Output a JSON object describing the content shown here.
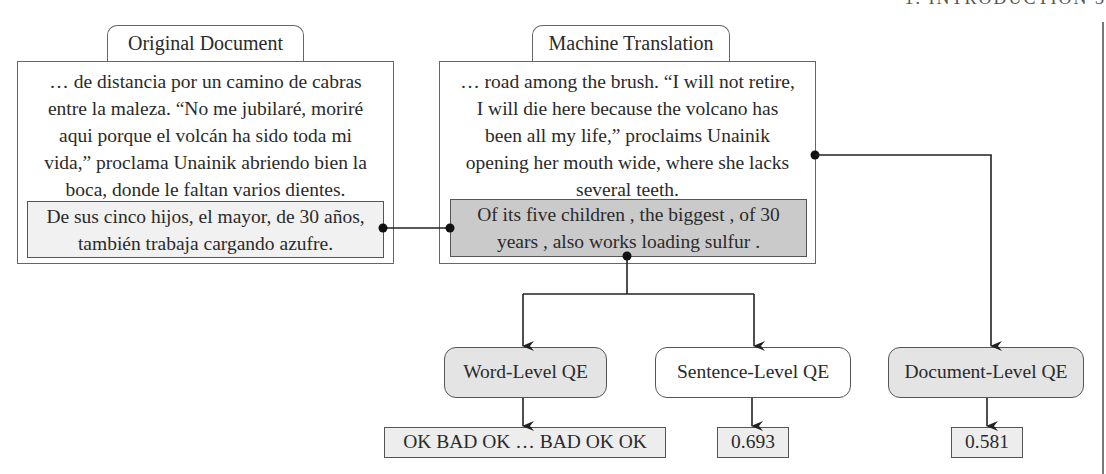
{
  "page_header": "1. INTRODUCTION   3",
  "original_document": {
    "tab_label": "Original Document",
    "context_lines": [
      "… de distancia por un camino de cabras",
      "entre la maleza. “No me jubilaré, moriré",
      "aqui porque el volcán ha sido toda mi",
      "vida,” proclama Unainik abriendo bien la",
      "boca, donde le faltan varios dientes."
    ],
    "highlighted_sentence_lines": [
      "De sus cinco hijos, el mayor, de 30 años,",
      "también trabaja cargando azufre."
    ]
  },
  "machine_translation": {
    "tab_label": "Machine Translation",
    "context_lines": [
      "… road among the brush. “I will not retire,",
      "I will die here because the volcano has",
      "been all my life,” proclaims Unainik",
      "opening her mouth wide, where she lacks",
      "several teeth."
    ],
    "highlighted_sentence_lines": [
      "Of its five children , the biggest , of 30",
      "years , also works loading sulfur ."
    ]
  },
  "qe_levels": [
    {
      "label": "Word-Level QE",
      "result": "OK BAD OK … BAD OK OK",
      "highlighted": true
    },
    {
      "label": "Sentence-Level QE",
      "result": "0.693",
      "highlighted": false
    },
    {
      "label": "Document-Level QE",
      "result": "0.581",
      "highlighted": true
    }
  ],
  "colors": {
    "line": "#222222",
    "mt_sentence_fill": "#cacaca",
    "src_sentence_fill": "#f1f1f1",
    "qe_gray_fill": "#e4e4e4"
  }
}
